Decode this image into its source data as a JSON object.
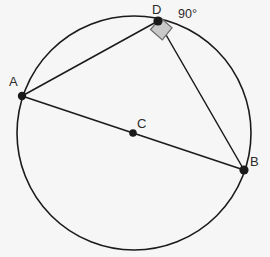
{
  "figure": {
    "type": "circle-geometry-diagram",
    "background_color": "#f7f6f6",
    "stroke_color": "#1a1a1a",
    "point_color": "#1a1a1a",
    "label_color": "#2b2b2b",
    "right_angle_fill": "#c9c9c9",
    "right_angle_stroke": "#6e6e6e",
    "circle": {
      "center_label": "C",
      "cx": 134,
      "cy": 133,
      "r": 117,
      "stroke_width": 1.6
    },
    "points": [
      {
        "id": "A",
        "label": "A",
        "x": 22,
        "y": 96,
        "r": 4.2,
        "label_x": 9,
        "label_y": 75
      },
      {
        "id": "B",
        "label": "B",
        "x": 244,
        "y": 170,
        "r": 4.6,
        "label_x": 250,
        "label_y": 155
      },
      {
        "id": "C",
        "label": "C",
        "x": 133,
        "y": 133,
        "r": 3.8,
        "label_x": 137,
        "label_y": 117
      },
      {
        "id": "D",
        "label": "D",
        "x": 158,
        "y": 21,
        "r": 4.6,
        "label_x": 152,
        "label_y": 3
      }
    ],
    "segments": [
      {
        "id": "AD",
        "from": "A",
        "to": "D",
        "x1": 22,
        "y1": 96,
        "x2": 158,
        "y2": 21,
        "width": 1.5
      },
      {
        "id": "DB",
        "from": "D",
        "to": "B",
        "x1": 158,
        "y1": 21,
        "x2": 244,
        "y2": 170,
        "width": 1.5
      },
      {
        "id": "AB",
        "from": "A",
        "to": "B",
        "x1": 22,
        "y1": 96,
        "x2": 244,
        "y2": 170,
        "width": 1.5
      }
    ],
    "right_angle_marker": {
      "at_vertex": "D",
      "points": "150.5,29.5 162.3,39.9 172.0,27.8 160.8,18.0",
      "stroke_width": 1.3
    },
    "annotations": {
      "angle_value": "90°",
      "angle_label_x": 178,
      "angle_label_y": 8
    }
  }
}
